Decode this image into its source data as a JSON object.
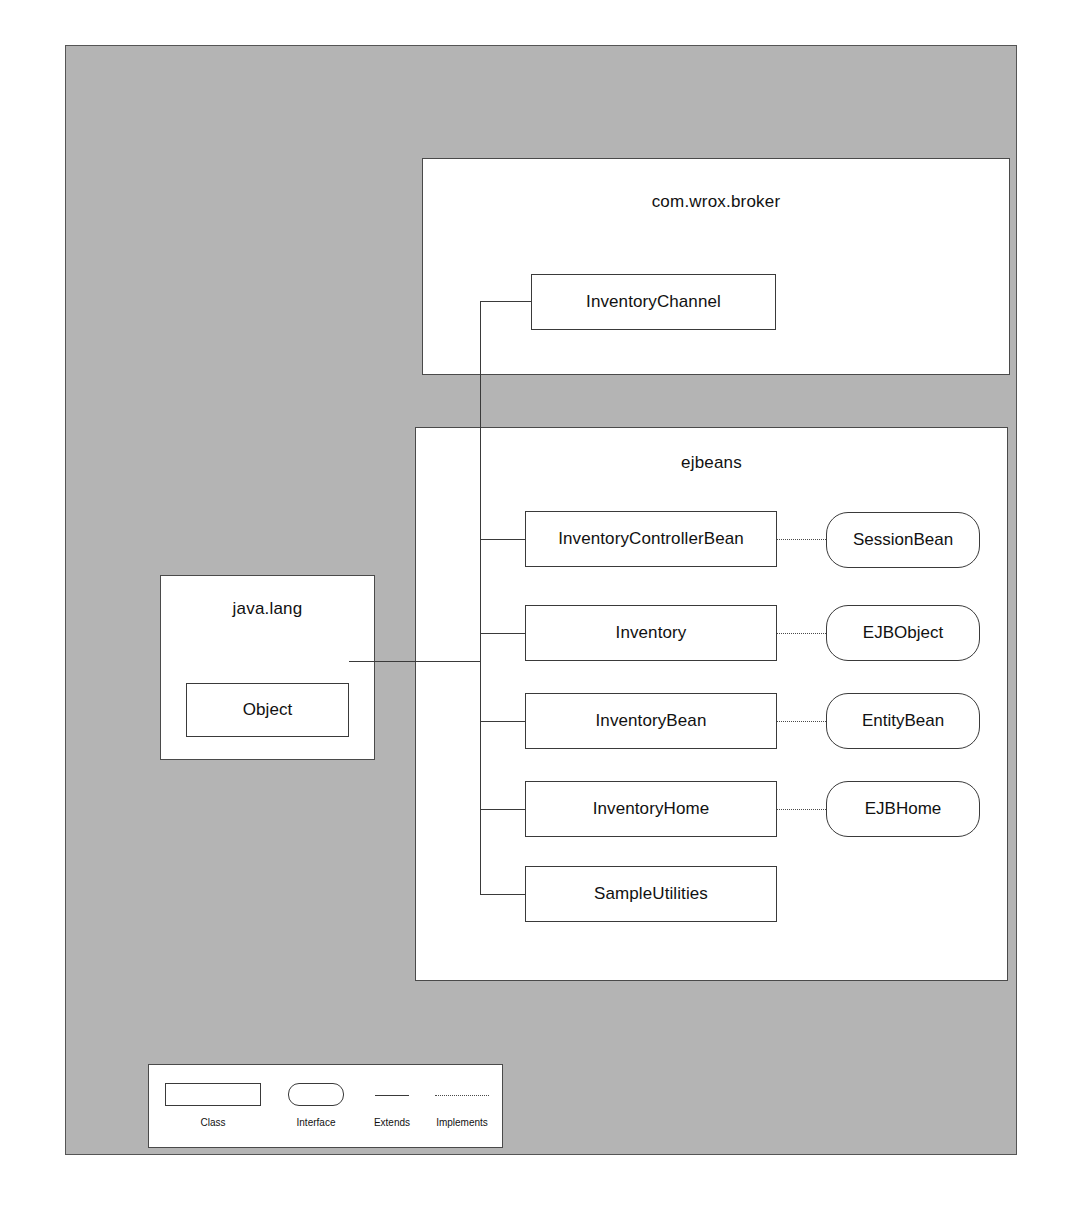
{
  "diagram": {
    "type": "uml-package-class-diagram",
    "packages": [
      {
        "id": "broker",
        "name": "com.wrox.broker",
        "classes": [
          "InventoryChannel"
        ]
      },
      {
        "id": "ejbeans",
        "name": "ejbeans",
        "classes": [
          "InventoryControllerBean",
          "Inventory",
          "InventoryBean",
          "InventoryHome",
          "SampleUtilities"
        ],
        "interfaces": [
          "SessionBean",
          "EJBObject",
          "EntityBean",
          "EJBHome"
        ]
      },
      {
        "id": "javalang",
        "name": "java.lang",
        "classes": [
          "Object"
        ]
      }
    ],
    "relationships": [
      {
        "type": "extends",
        "from": "InventoryChannel",
        "to": "Object"
      },
      {
        "type": "extends",
        "from": "InventoryControllerBean",
        "to": "Object"
      },
      {
        "type": "extends",
        "from": "Inventory",
        "to": "Object"
      },
      {
        "type": "extends",
        "from": "InventoryBean",
        "to": "Object"
      },
      {
        "type": "extends",
        "from": "InventoryHome",
        "to": "Object"
      },
      {
        "type": "extends",
        "from": "SampleUtilities",
        "to": "Object"
      },
      {
        "type": "implements",
        "from": "InventoryControllerBean",
        "to": "SessionBean"
      },
      {
        "type": "implements",
        "from": "Inventory",
        "to": "EJBObject"
      },
      {
        "type": "implements",
        "from": "InventoryBean",
        "to": "EntityBean"
      },
      {
        "type": "implements",
        "from": "InventoryHome",
        "to": "EJBHome"
      }
    ]
  },
  "broker": {
    "title": "com.wrox.broker",
    "class_inventory_channel": "InventoryChannel"
  },
  "ejbeans": {
    "title": "ejbeans",
    "class_inventory_controller_bean": "InventoryControllerBean",
    "class_inventory": "Inventory",
    "class_inventory_bean": "InventoryBean",
    "class_inventory_home": "InventoryHome",
    "class_sample_utilities": "SampleUtilities",
    "interface_session_bean": "SessionBean",
    "interface_ejb_object": "EJBObject",
    "interface_entity_bean": "EntityBean",
    "interface_ejb_home": "EJBHome"
  },
  "javalang": {
    "title": "java.lang",
    "class_object": "Object"
  },
  "legend": {
    "class_label": "Class",
    "interface_label": "Interface",
    "extends_label": "Extends",
    "implements_label": "Implements"
  },
  "colors": {
    "frame_background": "#b4b4b4",
    "panel_background": "#ffffff",
    "line": "#3a3a3a",
    "text": "#111111"
  }
}
